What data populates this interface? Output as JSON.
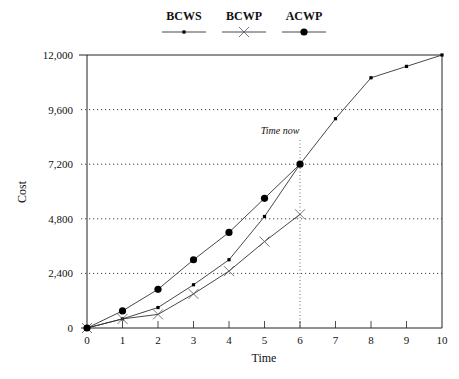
{
  "chart_data": {
    "type": "line",
    "title": "",
    "xlabel": "Time",
    "ylabel": "Cost",
    "xlim": [
      0,
      10
    ],
    "ylim": [
      0,
      12000
    ],
    "x_ticks": [
      0,
      1,
      2,
      3,
      4,
      5,
      6,
      7,
      8,
      9,
      10
    ],
    "x_tick_labels": [
      "0",
      "1",
      "2",
      "3",
      "4",
      "5",
      "6",
      "7",
      "8",
      "9",
      "10"
    ],
    "y_ticks": [
      0,
      2400,
      4800,
      7200,
      9600,
      12000
    ],
    "y_tick_labels": [
      "0",
      "2,400",
      "4,800",
      "7,200",
      "9,600",
      "12,000"
    ],
    "grid": "horizontal dotted",
    "legend_position": "top-center",
    "series": [
      {
        "name": "BCWS",
        "marker": "small-square",
        "x": [
          0,
          1,
          2,
          3,
          4,
          5,
          6,
          7,
          8,
          9,
          10
        ],
        "values": [
          0,
          400,
          900,
          1900,
          3000,
          4900,
          7200,
          9200,
          11000,
          11500,
          12000
        ]
      },
      {
        "name": "BCWP",
        "marker": "x",
        "x": [
          0,
          1,
          2,
          3,
          4,
          5,
          6
        ],
        "values": [
          0,
          400,
          600,
          1500,
          2500,
          3800,
          5000
        ]
      },
      {
        "name": "ACWP",
        "marker": "filled-circle",
        "x": [
          0,
          1,
          2,
          3,
          4,
          5,
          6
        ],
        "values": [
          0,
          750,
          1700,
          3000,
          4200,
          5700,
          7200
        ]
      }
    ],
    "annotations": [
      {
        "text": "Time now",
        "x": 6,
        "type": "vertical-dotted-line"
      }
    ]
  },
  "colors": {
    "line": "#333333",
    "marker": "#000000",
    "grid": "#333333"
  }
}
